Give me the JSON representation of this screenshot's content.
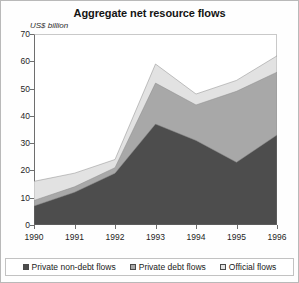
{
  "chart_data": {
    "type": "area",
    "title": "Aggregate net resource flows",
    "ylabel": "US$ billion",
    "xlabel": "",
    "ylim": [
      0,
      70
    ],
    "yticks": [
      0,
      10,
      20,
      30,
      40,
      50,
      60,
      70
    ],
    "grid": false,
    "stacked": true,
    "legend_position": "bottom",
    "categories": [
      "1990",
      "1991",
      "1992",
      "1993",
      "1994",
      "1995",
      "1996"
    ],
    "x": [
      1990,
      1991,
      1992,
      1993,
      1994,
      1995,
      1996
    ],
    "series": [
      {
        "name": "Private non-debt flows",
        "color": "#4d4d4d",
        "values": [
          7,
          12,
          19,
          37,
          31,
          23,
          33
        ]
      },
      {
        "name": "Private debt flows",
        "color": "#a8a8a8",
        "values": [
          2,
          2,
          2,
          15,
          13,
          26,
          23
        ]
      },
      {
        "name": "Official flows",
        "color": "#e2e2e2",
        "values": [
          7,
          5,
          3,
          7,
          4,
          4,
          6
        ]
      }
    ],
    "cumulative_totals": [
      16,
      19,
      24,
      59,
      48,
      53,
      62
    ],
    "colors": {
      "private_non_debt": "#4d4d4d",
      "private_debt": "#a8a8a8",
      "official": "#e2e2e2",
      "axis": "#6e6e6e",
      "frame": "#c9c9c9",
      "text": "#1a1a1a"
    }
  },
  "legend": {
    "items": [
      {
        "label": "Private non-debt flows"
      },
      {
        "label": "Private debt flows"
      },
      {
        "label": "Official flows"
      }
    ]
  }
}
